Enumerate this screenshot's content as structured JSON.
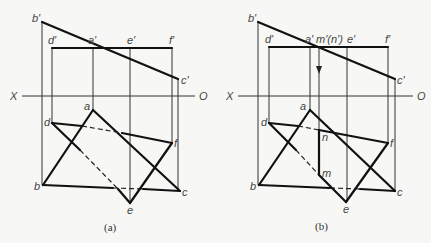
{
  "figures": [
    {
      "caption": "(a)",
      "axis": {
        "left": "X",
        "right": "O"
      },
      "labels": {
        "b_prime": "b'",
        "d_prime": "d'",
        "a_prime": "a'",
        "e_prime": "e'",
        "f_prime": "f'",
        "c_prime": "c'",
        "a": "a",
        "d": "d",
        "f": "f",
        "b": "b",
        "c": "c",
        "e": "e"
      }
    },
    {
      "caption": "(b)",
      "axis": {
        "left": "X",
        "right": "O"
      },
      "labels": {
        "b_prime": "b'",
        "d_prime": "d'",
        "a_prime": "a'",
        "mn_prime": "m'(n')",
        "e_prime": "e'",
        "f_prime": "f'",
        "c_prime": "c'",
        "a": "a",
        "d": "d",
        "n": "n",
        "f": "f",
        "m": "m",
        "b": "b",
        "c": "c",
        "e": "e"
      }
    }
  ]
}
